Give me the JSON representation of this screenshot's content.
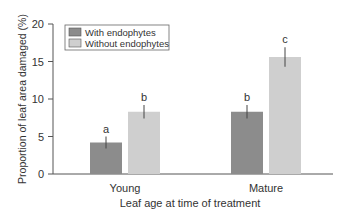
{
  "chart_data": {
    "type": "bar",
    "title": "",
    "xlabel": "Leaf age at time of treatment",
    "ylabel": "Proportion of leaf area damaged (%)",
    "ylim": [
      0,
      20
    ],
    "yticks": [
      0,
      5,
      10,
      15,
      20
    ],
    "categories": [
      "Young",
      "Mature"
    ],
    "series": [
      {
        "name": "With endophytes",
        "color": "#8c8c8c",
        "values": [
          4.2,
          8.3
        ],
        "errors": [
          0.8,
          0.9
        ],
        "labels": [
          "a",
          "b"
        ]
      },
      {
        "name": "Without endophytes",
        "color": "#cfcfcf",
        "values": [
          8.3,
          15.6
        ],
        "errors": [
          0.9,
          1.3
        ],
        "labels": [
          "b",
          "c"
        ]
      }
    ],
    "legend_position": "top-left",
    "grid": false
  }
}
